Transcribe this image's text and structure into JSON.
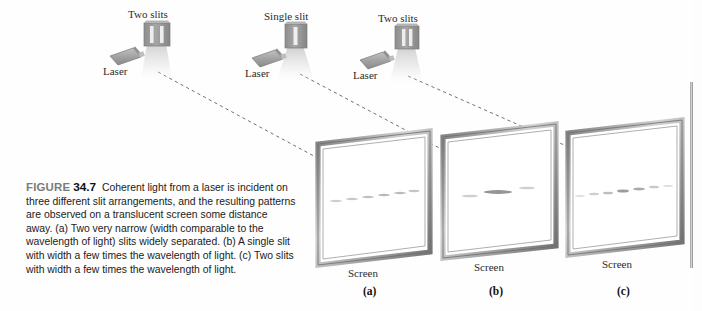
{
  "figure": {
    "label_word": "FIGURE",
    "number": "34.7",
    "caption": "Coherent light from a laser is incident on three different slit arrangements, and the resulting patterns are observed on a translucent screen some distance away. (a) Two very narrow (width comparable to the wavelength of light) slits widely separated. (b) A single slit with width a few times the wavelength of light. (c) Two slits with width a few times the wavelength of light."
  },
  "colors": {
    "frame_dark": "#6f6f6f",
    "frame_light": "#d9d9d9",
    "slit_plate": "#9a9a9a",
    "laser_body": "#a8a8a8",
    "beam": "#e3e3e3",
    "ray_dash": "#4a4a4a",
    "text": "#1a1a1a",
    "figure_word": "#7b7b7b"
  },
  "setups": [
    {
      "id": "a",
      "slit_label": "Two slits",
      "laser_label": "Laser",
      "screen_label": "Screen",
      "panel_letter": "(a)",
      "slit_count": 2,
      "slit_spacing": "wide",
      "slit_width": "very narrow",
      "beam_spread": "narrow",
      "pattern": "evenly spaced equal-brightness interference fringes"
    },
    {
      "id": "b",
      "slit_label": "Single slit",
      "laser_label": "Laser",
      "screen_label": "Screen",
      "panel_letter": "(b)",
      "slit_count": 1,
      "slit_spacing": "none",
      "slit_width": "a few wavelengths",
      "beam_spread": "wide",
      "pattern": "bright central maximum with weak side lobes"
    },
    {
      "id": "c",
      "slit_label": "Two slits",
      "laser_label": "Laser",
      "screen_label": "Screen",
      "panel_letter": "(c)",
      "slit_count": 2,
      "slit_spacing": "narrow",
      "slit_width": "a few wavelengths",
      "beam_spread": "medium",
      "pattern": "interference fringes under a diffraction envelope"
    }
  ]
}
